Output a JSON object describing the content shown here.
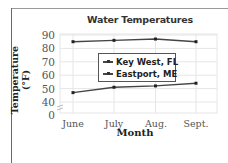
{
  "chart_data": {
    "type": "line",
    "title": "Water Temperatures",
    "xlabel": "Month",
    "ylabel": "Temperature (°F)",
    "categories": [
      "June",
      "July",
      "Aug.",
      "Sept."
    ],
    "series": [
      {
        "name": "Key West, FL",
        "values": [
          85,
          86,
          87,
          85
        ],
        "color": "#444444"
      },
      {
        "name": "Eastport, ME",
        "values": [
          47,
          51,
          52,
          54
        ],
        "color": "#444444"
      }
    ],
    "yticks": [
      "90",
      "80",
      "70",
      "60",
      "50",
      "40",
      "0"
    ],
    "ylim": [
      0,
      90
    ],
    "y_axis_break": "between 0 and 40",
    "grid": true,
    "legend_position": "inside center"
  }
}
